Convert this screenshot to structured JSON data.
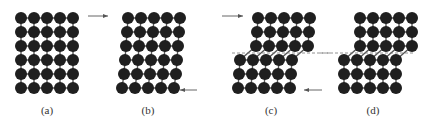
{
  "figure": {
    "atom_color": "#1f1f1f",
    "line_color": "#555555",
    "panels": [
      {
        "id": "a",
        "caption": "(a)",
        "caption_x": 47,
        "rows": [
          {
            "x0": 21,
            "y": 18,
            "count": 5
          },
          {
            "x0": 21,
            "y": 32,
            "count": 5
          },
          {
            "x0": 21,
            "y": 46,
            "count": 5
          },
          {
            "x0": 21,
            "y": 60,
            "count": 5
          },
          {
            "x0": 21,
            "y": 74,
            "count": 5
          },
          {
            "x0": 21,
            "y": 88,
            "count": 5
          }
        ]
      },
      {
        "id": "b",
        "caption": "(b)",
        "caption_x": 148,
        "rows": [
          {
            "x0": 128,
            "y": 18,
            "count": 5
          },
          {
            "x0": 127,
            "y": 32,
            "count": 5
          },
          {
            "x0": 126,
            "y": 46,
            "count": 5
          },
          {
            "x0": 125,
            "y": 60,
            "count": 5
          },
          {
            "x0": 124,
            "y": 74,
            "count": 5
          },
          {
            "x0": 122,
            "y": 88,
            "count": 5
          }
        ]
      },
      {
        "id": "c",
        "caption": "(c)",
        "caption_x": 271,
        "rows": [
          {
            "x0": 258,
            "y": 18,
            "count": 5
          },
          {
            "x0": 257,
            "y": 32,
            "count": 5
          },
          {
            "x0": 256,
            "y": 46,
            "count": 5
          },
          {
            "x0": 240,
            "y": 60,
            "count": 5
          },
          {
            "x0": 239,
            "y": 74,
            "count": 5
          },
          {
            "x0": 238,
            "y": 88,
            "count": 5
          }
        ],
        "slip_line": {
          "x1": 232,
          "x2": 330,
          "y": 53
        }
      },
      {
        "id": "d",
        "caption": "(d)",
        "caption_x": 373,
        "rows": [
          {
            "x0": 360,
            "y": 18,
            "count": 5
          },
          {
            "x0": 360,
            "y": 32,
            "count": 5
          },
          {
            "x0": 360,
            "y": 46,
            "count": 5
          },
          {
            "x0": 344,
            "y": 60,
            "count": 5
          },
          {
            "x0": 344,
            "y": 74,
            "count": 5
          },
          {
            "x0": 344,
            "y": 88,
            "count": 5
          }
        ],
        "slip_line": {
          "x1": 320,
          "x2": 415,
          "y": 53
        }
      }
    ],
    "pitch": 13,
    "atom_radius": 6,
    "arrows": [
      {
        "name": "force-arrow-a-to-b-top",
        "x1": 88,
        "y1": 16,
        "x2": 108,
        "y2": 16
      },
      {
        "name": "force-arrow-b-bottom",
        "x1": 197,
        "y1": 90,
        "x2": 180,
        "y2": 90
      },
      {
        "name": "force-arrow-c-top",
        "x1": 222,
        "y1": 16,
        "x2": 243,
        "y2": 16
      },
      {
        "name": "force-arrow-c-bottom",
        "x1": 322,
        "y1": 90,
        "x2": 304,
        "y2": 90
      }
    ]
  }
}
